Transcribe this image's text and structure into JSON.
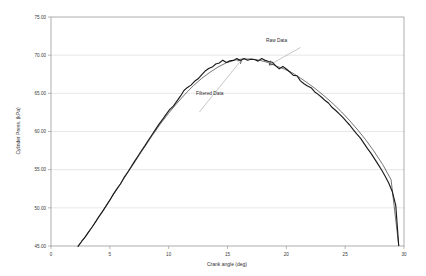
{
  "chart_data": {
    "type": "line",
    "title": "",
    "xlabel": "Crank angle (deg)",
    "ylabel": "Cylinder Press. (kPa)",
    "xlim": [
      0,
      30
    ],
    "ylim": [
      45.0,
      75.0
    ],
    "xticks": [
      0,
      5,
      10,
      15,
      20,
      25,
      30
    ],
    "xtick_labels": [
      "0",
      "5",
      "10",
      "15",
      "20",
      "25",
      "30"
    ],
    "yticks": [
      45.0,
      50.0,
      55.0,
      60.0,
      65.0,
      70.0,
      75.0
    ],
    "ytick_labels": [
      "45.00",
      "50.00",
      "55.00",
      "60.00",
      "65.00",
      "70.00",
      "75.00"
    ],
    "grid": "horizontal",
    "legend": "none",
    "annotations": [
      {
        "text": "Raw Data",
        "x": 21.2,
        "y": 71.2
      },
      {
        "text": "Filtered Data",
        "x": 12.6,
        "y": 62.4
      }
    ],
    "series": [
      {
        "name": "Raw Data",
        "color": "#1a1a1a",
        "x": [
          2.3,
          2.6,
          2.9,
          3.2,
          3.5,
          3.8,
          4.1,
          4.4,
          4.7,
          5.0,
          5.3,
          5.6,
          5.9,
          6.2,
          6.5,
          6.8,
          7.1,
          7.4,
          7.7,
          8.0,
          8.3,
          8.6,
          8.9,
          9.2,
          9.5,
          9.8,
          10.1,
          10.4,
          10.7,
          11.0,
          11.3,
          11.6,
          11.9,
          12.2,
          12.5,
          12.8,
          13.1,
          13.4,
          13.7,
          14.0,
          14.3,
          14.6,
          14.9,
          15.2,
          15.5,
          15.8,
          16.1,
          16.4,
          16.7,
          17.0,
          17.3,
          17.6,
          17.9,
          18.2,
          18.5,
          18.8,
          19.1,
          19.4,
          19.7,
          20.0,
          20.3,
          20.6,
          20.9,
          21.2,
          21.5,
          21.8,
          22.1,
          22.4,
          22.7,
          23.0,
          23.3,
          23.6,
          23.9,
          24.2,
          24.5,
          24.8,
          25.1,
          25.4,
          25.7,
          26.0,
          26.3,
          26.6,
          26.9,
          27.2,
          27.5,
          27.8,
          28.1,
          28.4,
          28.7,
          29.0,
          29.3,
          29.55
        ],
        "y": [
          45.0,
          45.55,
          46.2,
          46.85,
          47.5,
          48.2,
          48.9,
          49.6,
          50.3,
          51.0,
          51.75,
          52.45,
          53.15,
          53.9,
          54.6,
          55.35,
          56.05,
          56.8,
          57.5,
          58.2,
          58.9,
          59.6,
          60.3,
          61.0,
          61.65,
          62.3,
          62.9,
          63.5,
          64.1,
          64.65,
          65.2,
          65.7,
          66.15,
          66.6,
          67.0,
          67.4,
          67.75,
          68.1,
          68.45,
          68.75,
          68.95,
          69.2,
          69.05,
          69.35,
          69.25,
          69.45,
          69.35,
          69.55,
          69.45,
          69.6,
          69.5,
          69.35,
          69.45,
          69.3,
          69.2,
          68.95,
          68.6,
          68.3,
          68.6,
          68.3,
          67.9,
          67.5,
          67.2,
          66.8,
          66.4,
          66.1,
          65.7,
          65.3,
          64.9,
          64.55,
          64.1,
          63.7,
          63.25,
          62.8,
          62.35,
          61.85,
          61.35,
          60.8,
          60.25,
          59.7,
          59.1,
          58.45,
          57.8,
          57.15,
          56.45,
          55.7,
          54.95,
          54.15,
          53.25,
          52.1,
          50.3,
          45.1
        ]
      },
      {
        "name": "Filtered Data",
        "color": "#2a2a2a",
        "x": [
          2.3,
          3.0,
          3.7,
          4.4,
          5.1,
          5.8,
          6.5,
          7.2,
          7.9,
          8.6,
          9.3,
          10.0,
          10.7,
          11.4,
          12.1,
          12.8,
          13.5,
          14.2,
          14.9,
          15.6,
          16.3,
          17.0,
          17.7,
          18.4,
          19.1,
          19.8,
          20.5,
          21.2,
          21.9,
          22.6,
          23.3,
          24.0,
          24.7,
          25.4,
          26.1,
          26.8,
          27.5,
          28.2,
          28.9,
          29.55
        ],
        "y": [
          45.0,
          46.4,
          47.95,
          49.6,
          51.25,
          52.9,
          54.55,
          56.2,
          57.85,
          59.45,
          61.0,
          62.4,
          63.7,
          64.9,
          66.0,
          66.95,
          67.75,
          68.45,
          69.0,
          69.35,
          69.5,
          69.5,
          69.35,
          69.05,
          68.6,
          68.2,
          67.7,
          67.0,
          66.25,
          65.45,
          64.55,
          63.6,
          62.55,
          61.4,
          60.15,
          58.8,
          57.3,
          55.65,
          53.7,
          45.1
        ]
      }
    ]
  },
  "axes": {
    "y_title": "Cylinder Press. (kPa)",
    "x_title": "Crank angle (deg)"
  },
  "annotation_raw": "Raw Data",
  "annotation_filtered": "Filtered Data"
}
